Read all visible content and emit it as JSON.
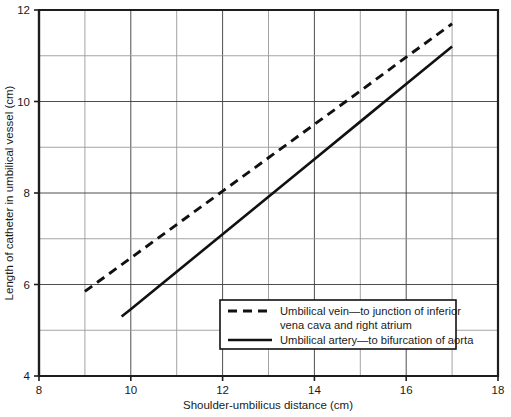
{
  "chart_data": {
    "type": "line",
    "title": "",
    "subtitle": "",
    "xlabel": "Shoulder-umbilicus distance (cm)",
    "ylabel": "Length of catheter in umbilical vessel (cm)",
    "xlim": [
      8,
      18
    ],
    "ylim": [
      4,
      12
    ],
    "xticks": [
      8,
      10,
      12,
      14,
      16,
      18
    ],
    "xtick_labels": [
      "8",
      "10",
      "12",
      "14",
      "16",
      "18"
    ],
    "yticks": [
      4,
      6,
      8,
      10,
      12
    ],
    "ytick_labels": [
      "4",
      "6",
      "8",
      "10",
      "12"
    ],
    "x_minor_step": 1,
    "y_minor_step": 1,
    "grid": true,
    "grid_major_every": 2,
    "legend_position": "lower-right-inside",
    "series": [
      {
        "name": "Umbilical vein—to junction of inferior vena cava and right atrium",
        "style": "dashed",
        "color": "#111111",
        "x": [
          9.0,
          10.0,
          11.0,
          12.0,
          13.0,
          14.0,
          15.0,
          16.0,
          17.0
        ],
        "y": [
          5.85,
          6.58,
          7.31,
          8.04,
          8.77,
          9.5,
          10.23,
          10.97,
          11.7
        ]
      },
      {
        "name": "Umbilical artery—to bifurcation of aorta",
        "style": "solid",
        "color": "#111111",
        "x": [
          9.8,
          10.0,
          11.0,
          12.0,
          13.0,
          14.0,
          15.0,
          16.0,
          17.0
        ],
        "y": [
          5.3,
          5.46,
          6.28,
          7.1,
          7.92,
          8.74,
          9.56,
          10.38,
          11.2
        ]
      }
    ]
  },
  "legend": {
    "entries": [
      {
        "swatch": "dashed-line-swatch",
        "line1": "Umbilical vein—to junction of inferior",
        "line2": "vena cava and right atrium"
      },
      {
        "swatch": "solid-line-swatch",
        "line1": "Umbilical artery—to bifurcation of aorta",
        "line2": ""
      }
    ]
  },
  "axes": {
    "x_title": "Shoulder-umbilicus distance (cm)",
    "y_title": "Length of catheter in umbilical vessel (cm)",
    "x_tick_labels": [
      "8",
      "10",
      "12",
      "14",
      "16",
      "18"
    ],
    "y_tick_labels": [
      "12",
      "10",
      "8",
      "6",
      "4"
    ]
  },
  "colors": {
    "line": "#111111",
    "grid_major": "#3a3a3a",
    "grid_minor": "#9a9a9a",
    "frame": "#1d1d1d",
    "background": "#ffffff"
  }
}
